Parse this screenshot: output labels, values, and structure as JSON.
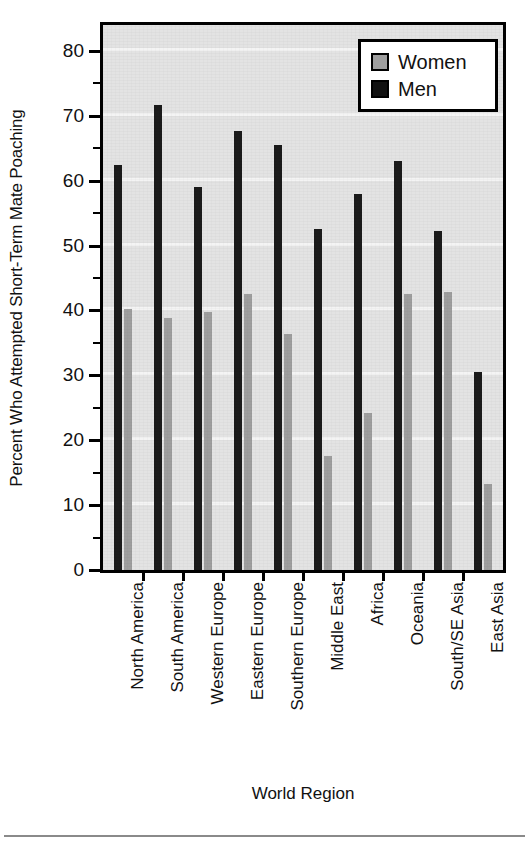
{
  "chart_data": {
    "type": "bar",
    "title": "",
    "xlabel": "World Region",
    "ylabel": "Percent Who Attempted Short-Term Mate Poaching",
    "categories": [
      "North America",
      "South America",
      "Western Europe",
      "Eastern Europe",
      "Southern Europe",
      "Middle East",
      "Africa",
      "Oceania",
      "South/SE Asia",
      "East Asia"
    ],
    "series": [
      {
        "name": "Women",
        "color": "#9e9e9e",
        "values": [
          40.2,
          38.8,
          39.7,
          42.5,
          36.3,
          17.6,
          24.2,
          42.6,
          42.8,
          13.3
        ]
      },
      {
        "name": "Men",
        "color": "#1b1b1b",
        "values": [
          62.4,
          71.7,
          59.0,
          67.6,
          65.5,
          52.5,
          57.9,
          63.1,
          52.3,
          30.5
        ]
      }
    ],
    "ylim": [
      0,
      84
    ],
    "ytick_labels": [
      "0",
      "10",
      "20",
      "30",
      "40",
      "50",
      "60",
      "70",
      "80"
    ],
    "ytick_values": [
      0,
      10,
      20,
      30,
      40,
      50,
      60,
      70,
      80
    ],
    "yminor_step": 5,
    "grid": "horizontal",
    "legend_position": "top-right",
    "legend_entries": [
      "Women",
      "Men"
    ]
  }
}
